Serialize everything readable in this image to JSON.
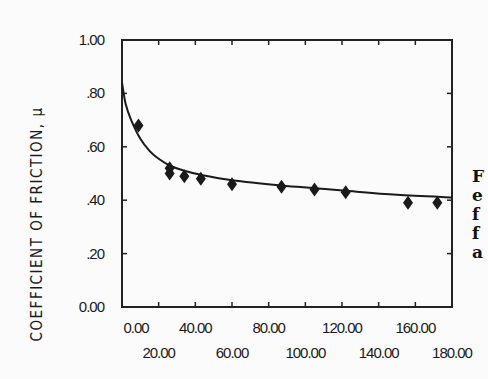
{
  "chart_data": {
    "type": "scatter",
    "title": "",
    "xlabel": "",
    "ylabel": "COEFFICIENT OF FRICTION, μ",
    "xlim": [
      0,
      180
    ],
    "ylim": [
      0,
      1.0
    ],
    "grid": false,
    "x_ticks": [
      0,
      20,
      40,
      60,
      80,
      100,
      120,
      140,
      160,
      180
    ],
    "x_tick_labels": [
      "0.00",
      "20.00",
      "40.00",
      "60.00",
      "80.00",
      "100.00",
      "120.00",
      "140.00",
      "160.00",
      "180.00"
    ],
    "y_ticks": [
      0,
      0.2,
      0.4,
      0.6,
      0.8,
      1.0
    ],
    "y_tick_labels": [
      "0.00",
      ".20",
      ".40",
      ".60",
      ".80",
      "1.00"
    ],
    "series": [
      {
        "name": "measured",
        "marker": "diamond",
        "points": [
          {
            "x": 9,
            "y": 0.68
          },
          {
            "x": 26,
            "y": 0.52
          },
          {
            "x": 26,
            "y": 0.5
          },
          {
            "x": 34,
            "y": 0.49
          },
          {
            "x": 43,
            "y": 0.48
          },
          {
            "x": 60,
            "y": 0.46
          },
          {
            "x": 87,
            "y": 0.45
          },
          {
            "x": 105,
            "y": 0.44
          },
          {
            "x": 122,
            "y": 0.43
          },
          {
            "x": 156,
            "y": 0.39
          },
          {
            "x": 172,
            "y": 0.39
          }
        ]
      },
      {
        "name": "fitted curve",
        "style": "line",
        "points": [
          {
            "x": 0,
            "y": 0.84
          },
          {
            "x": 2,
            "y": 0.76
          },
          {
            "x": 5,
            "y": 0.7
          },
          {
            "x": 10,
            "y": 0.63
          },
          {
            "x": 15,
            "y": 0.585
          },
          {
            "x": 20,
            "y": 0.555
          },
          {
            "x": 26,
            "y": 0.53
          },
          {
            "x": 34,
            "y": 0.51
          },
          {
            "x": 43,
            "y": 0.495
          },
          {
            "x": 60,
            "y": 0.475
          },
          {
            "x": 87,
            "y": 0.455
          },
          {
            "x": 105,
            "y": 0.445
          },
          {
            "x": 122,
            "y": 0.435
          },
          {
            "x": 150,
            "y": 0.42
          },
          {
            "x": 180,
            "y": 0.41
          }
        ]
      }
    ]
  },
  "caption_fragment": [
    "F",
    "e",
    "f",
    "f",
    "a"
  ]
}
